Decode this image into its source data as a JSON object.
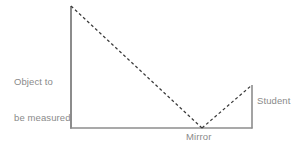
{
  "diagram": {
    "background_color": "#ffffff",
    "line_color": "#8c8c8c",
    "ray_color": "#3a3a3a",
    "text_color": "#8a8a8a",
    "labels": {
      "object_line1": "Object to",
      "object_line2": "be measured",
      "mirror": "Mirror",
      "student": "Student"
    },
    "geometry": {
      "object_top": {
        "x": 71,
        "y": 6
      },
      "object_base": {
        "x": 71,
        "y": 128
      },
      "ground_left": {
        "x": 70,
        "y": 128
      },
      "ground_right": {
        "x": 252,
        "y": 128
      },
      "mirror_point": {
        "x": 202,
        "y": 128
      },
      "student_top": {
        "x": 252,
        "y": 85
      },
      "student_base": {
        "x": 252,
        "y": 128
      }
    },
    "rays": {
      "incident_label": "incident-ray",
      "reflected_label": "reflected-ray",
      "dash_pattern": "3,2.5",
      "stroke_width": 1.2
    }
  }
}
